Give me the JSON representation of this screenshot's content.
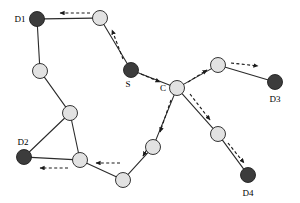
{
  "figure": {
    "type": "network-routing-diagram",
    "width": 300,
    "height": 203,
    "background": "#ffffff"
  },
  "style": {
    "dark_node_fill": "#3c3c3c",
    "light_node_fill": "#e2e2e2",
    "node_stroke": "#202020",
    "edge_color": "#2b2b2b",
    "arrow_color": "#1a1a1a",
    "label_color": "#000000",
    "node_radius": 7.5,
    "edge_width": 1.1,
    "arrow_dash": "3,2.4"
  },
  "nodes": [
    {
      "id": "D1",
      "label": "D1",
      "x": 37,
      "y": 19,
      "kind": "dark",
      "label_dx": -17,
      "label_dy": 3
    },
    {
      "id": "n1",
      "label": "",
      "x": 100,
      "y": 18,
      "kind": "light",
      "label_dx": 0,
      "label_dy": 0
    },
    {
      "id": "n2",
      "label": "",
      "x": 40,
      "y": 71,
      "kind": "light",
      "label_dx": 0,
      "label_dy": 0
    },
    {
      "id": "n3",
      "label": "",
      "x": 70,
      "y": 113,
      "kind": "light",
      "label_dx": 0,
      "label_dy": 0
    },
    {
      "id": "D2",
      "label": "D2",
      "x": 24,
      "y": 157,
      "kind": "dark",
      "label_dx": -1,
      "label_dy": -12
    },
    {
      "id": "n4",
      "label": "",
      "x": 80,
      "y": 160,
      "kind": "light",
      "label_dx": 0,
      "label_dy": 0
    },
    {
      "id": "n5",
      "label": "",
      "x": 123,
      "y": 180,
      "kind": "light",
      "label_dx": 0,
      "label_dy": 0
    },
    {
      "id": "n6",
      "label": "",
      "x": 153,
      "y": 147,
      "kind": "light",
      "label_dx": 0,
      "label_dy": 0
    },
    {
      "id": "S",
      "label": "S",
      "x": 131,
      "y": 70,
      "kind": "dark",
      "label_dx": -3,
      "label_dy": 17
    },
    {
      "id": "C",
      "label": "C",
      "x": 177,
      "y": 88,
      "kind": "light",
      "label_dx": -14,
      "label_dy": 3
    },
    {
      "id": "n7",
      "label": "",
      "x": 218,
      "y": 65,
      "kind": "light",
      "label_dx": 0,
      "label_dy": 0
    },
    {
      "id": "D3",
      "label": "D3",
      "x": 275,
      "y": 82,
      "kind": "dark",
      "label_dx": 0,
      "label_dy": 20
    },
    {
      "id": "n8",
      "label": "",
      "x": 218,
      "y": 134,
      "kind": "light",
      "label_dx": 0,
      "label_dy": 0
    },
    {
      "id": "D4",
      "label": "D4",
      "x": 248,
      "y": 175,
      "kind": "dark",
      "label_dx": 0,
      "label_dy": 21
    }
  ],
  "edges": [
    {
      "from": "D1",
      "to": "n1"
    },
    {
      "from": "D1",
      "to": "n2"
    },
    {
      "from": "n2",
      "to": "n3"
    },
    {
      "from": "n3",
      "to": "D2"
    },
    {
      "from": "n3",
      "to": "n4"
    },
    {
      "from": "D2",
      "to": "n4"
    },
    {
      "from": "n4",
      "to": "n5"
    },
    {
      "from": "n5",
      "to": "n6"
    },
    {
      "from": "n6",
      "to": "C"
    },
    {
      "from": "n1",
      "to": "S"
    },
    {
      "from": "S",
      "to": "C"
    },
    {
      "from": "C",
      "to": "n7"
    },
    {
      "from": "n7",
      "to": "D3"
    },
    {
      "from": "C",
      "to": "n8"
    },
    {
      "from": "n8",
      "to": "D4"
    }
  ],
  "flow_arrows": [
    {
      "name": "arrow-n1-to-D1",
      "x1": 90,
      "y1": 13,
      "x2": 60,
      "y2": 13
    },
    {
      "name": "arrow-S-to-n1",
      "x1": 123,
      "y1": 59,
      "x2": 112,
      "y2": 30
    },
    {
      "name": "arrow-S-to-C",
      "x1": 141,
      "y1": 74,
      "x2": 160,
      "y2": 82
    },
    {
      "name": "arrow-C-to-n7",
      "x1": 188,
      "y1": 82,
      "x2": 207,
      "y2": 70
    },
    {
      "name": "arrow-n7-to-D3",
      "x1": 231,
      "y1": 63,
      "x2": 258,
      "y2": 66
    },
    {
      "name": "arrow-C-to-n8",
      "x1": 190,
      "y1": 94,
      "x2": 210,
      "y2": 120
    },
    {
      "name": "arrow-n8-to-D4",
      "x1": 228,
      "y1": 143,
      "x2": 244,
      "y2": 163
    },
    {
      "name": "arrow-C-to-n6",
      "x1": 171,
      "y1": 100,
      "x2": 160,
      "y2": 132
    },
    {
      "name": "arrow-n6-to-n5",
      "x1": 152,
      "y1": 141,
      "x2": 143,
      "y2": 156
    },
    {
      "name": "arrow-n5-to-n4",
      "x1": 120,
      "y1": 163,
      "x2": 96,
      "y2": 163
    },
    {
      "name": "arrow-n4-to-D2",
      "x1": 68,
      "y1": 168,
      "x2": 40,
      "y2": 168
    }
  ],
  "node_roles": {
    "S": "source",
    "C": "center-relay",
    "D1": "destination",
    "D2": "destination",
    "D3": "destination",
    "D4": "destination"
  }
}
